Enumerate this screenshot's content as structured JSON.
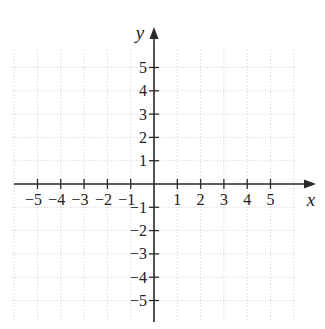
{
  "diagram": {
    "type": "coordinate-plane",
    "axis_labels": {
      "x": "x",
      "y": "y"
    },
    "x_ticks": [
      "−5",
      "−4",
      "−3",
      "−2",
      "−1",
      "1",
      "2",
      "3",
      "4",
      "5"
    ],
    "y_ticks": [
      "5",
      "4",
      "3",
      "2",
      "1",
      "−1",
      "−2",
      "−3",
      "−4",
      "−5"
    ],
    "x_tick_values": [
      -5,
      -4,
      -3,
      -2,
      -1,
      1,
      2,
      3,
      4,
      5
    ],
    "y_tick_values": [
      5,
      4,
      3,
      2,
      1,
      -1,
      -2,
      -3,
      -4,
      -5
    ],
    "grid": {
      "style": "dotted",
      "color": "#c8c8c8",
      "range_x": [
        -6,
        6
      ],
      "range_y": [
        -6,
        6
      ]
    },
    "colors": {
      "axis": "#2a2a2a",
      "grid": "#c8c8c8",
      "text": "#222222"
    }
  }
}
